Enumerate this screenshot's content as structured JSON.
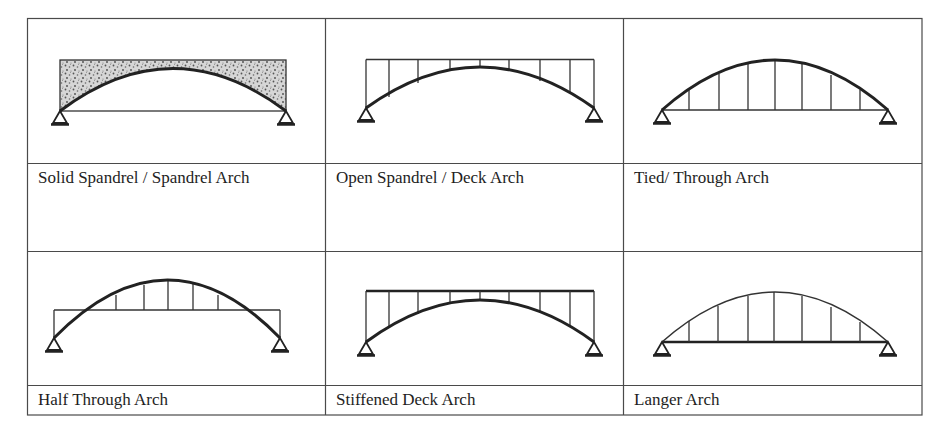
{
  "figure": {
    "layout": {
      "rows": 2,
      "cols": 3
    },
    "colors": {
      "line": "#333333",
      "fill_stipple": "#c8c8c8",
      "background": "#ffffff"
    },
    "cells": [
      {
        "id": "solid-spandrel",
        "label": "Solid Spandrel / Spandrel Arch"
      },
      {
        "id": "open-spandrel",
        "label": "Open Spandrel / Deck Arch"
      },
      {
        "id": "tied-through",
        "label": "Tied/ Through Arch"
      },
      {
        "id": "half-through",
        "label": "Half Through Arch"
      },
      {
        "id": "stiffened-deck",
        "label": "Stiffened Deck Arch"
      },
      {
        "id": "langer",
        "label": "Langer Arch"
      }
    ]
  }
}
